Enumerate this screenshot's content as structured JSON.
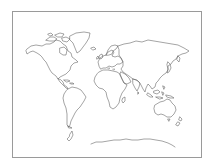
{
  "map": {
    "type": "blank-outline-world-map",
    "projection": "equirectangular-like",
    "frame": {
      "stroke": "#9a9a9a",
      "background": "#ffffff"
    },
    "outline_color": "#5a5a5a",
    "labels": [],
    "regions": [
      {
        "name": "north-america"
      },
      {
        "name": "greenland"
      },
      {
        "name": "central-america"
      },
      {
        "name": "south-america"
      },
      {
        "name": "europe"
      },
      {
        "name": "asia"
      },
      {
        "name": "africa"
      },
      {
        "name": "madagascar"
      },
      {
        "name": "arabian-peninsula"
      },
      {
        "name": "indian-subcontinent"
      },
      {
        "name": "southeast-asia-islands"
      },
      {
        "name": "japan"
      },
      {
        "name": "australia"
      },
      {
        "name": "new-zealand"
      },
      {
        "name": "antarctica"
      },
      {
        "name": "antarctic-peninsula"
      }
    ]
  }
}
